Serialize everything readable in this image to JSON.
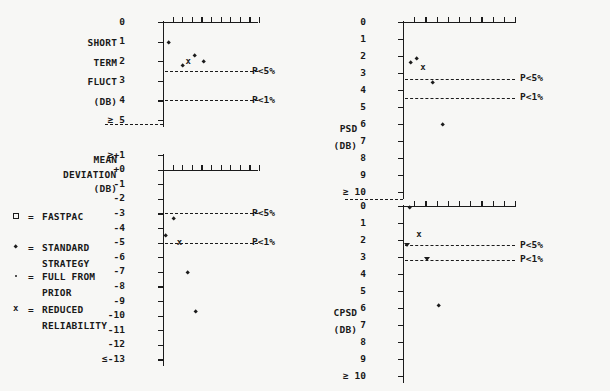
{
  "figure": {
    "kind": "four-panel-scatter",
    "background": "#f7f7f5",
    "ink": "#1b1b1b"
  },
  "legend": {
    "entries": [
      {
        "symbol": "open-square",
        "eq": "=",
        "line1": "FASTPAC",
        "line2": ""
      },
      {
        "symbol": "small-diamond",
        "eq": "=",
        "line1": "STANDARD",
        "line2": "STRATEGY"
      },
      {
        "symbol": "filled-dot",
        "eq": "=",
        "line1": "FULL FROM",
        "line2": "PRIOR"
      },
      {
        "symbol": "cross-x",
        "eq": "=",
        "line1": "REDUCED",
        "line2": "RELIABILITY"
      }
    ]
  },
  "significance_labels": {
    "p5": "P<5%",
    "p1": "P<1%"
  },
  "panels": [
    {
      "id": "short-term-fluct",
      "position": "top-left",
      "axis_title_lines": [
        "SHORT",
        "TERM",
        "FLUCT",
        "(DB)"
      ],
      "unit": "DB",
      "ytick_labels": [
        "0",
        "1",
        "2",
        "3",
        "4",
        "≥ 5"
      ],
      "yvalues": [
        0,
        1,
        2,
        3,
        4,
        5
      ],
      "xticks": 10,
      "ref_lines": [
        {
          "value": 2.5,
          "label": "P<5%"
        },
        {
          "value": 4.0,
          "label": "P<1%"
        }
      ],
      "points": [
        {
          "x": 0.55,
          "y": 1.05,
          "symbol": "small-diamond"
        },
        {
          "x": 2.1,
          "y": 2.25,
          "symbol": "small-diamond"
        },
        {
          "x": 2.65,
          "y": 2.05,
          "symbol": "cross-x"
        },
        {
          "x": 3.3,
          "y": 1.7,
          "symbol": "small-diamond"
        },
        {
          "x": 4.25,
          "y": 2.05,
          "symbol": "small-diamond"
        }
      ]
    },
    {
      "id": "mean-deviation",
      "position": "bottom-left",
      "axis_title_lines": [
        "MEAN",
        "DEVIATION",
        "(DB)"
      ],
      "unit": "DB",
      "ytick_labels": [
        "≥+1",
        "+0",
        "-1",
        "-2",
        "-3",
        "-4",
        "-5",
        "-6",
        "-7",
        "-8",
        "-9",
        "-10",
        "-11",
        "-12",
        "≤-13"
      ],
      "yvalues": [
        1,
        0,
        -1,
        -2,
        -3,
        -4,
        -5,
        -6,
        -7,
        -8,
        -9,
        -10,
        -11,
        -12,
        -13
      ],
      "xticks": 10,
      "ref_lines": [
        {
          "value": -3.0,
          "label": "P<5%"
        },
        {
          "value": -5.0,
          "label": "P<1%"
        }
      ],
      "points": [
        {
          "x": 1.1,
          "y": -3.35,
          "symbol": "small-diamond"
        },
        {
          "x": 0.28,
          "y": -4.55,
          "symbol": "small-diamond"
        },
        {
          "x": 1.75,
          "y": -5.05,
          "symbol": "cross-x"
        },
        {
          "x": 2.6,
          "y": -7.05,
          "symbol": "small-diamond"
        },
        {
          "x": 3.4,
          "y": -9.75,
          "symbol": "small-diamond"
        }
      ]
    },
    {
      "id": "psd",
      "position": "top-right",
      "axis_title_lines": [
        "PSD",
        "(DB)"
      ],
      "unit": "DB",
      "ytick_labels": [
        "0",
        "1",
        "2",
        "3",
        "4",
        "5",
        "6",
        "7",
        "8",
        "9",
        "≥ 10"
      ],
      "yvalues": [
        0,
        1,
        2,
        3,
        4,
        5,
        6,
        7,
        8,
        9,
        10
      ],
      "xticks": 10,
      "ref_lines": [
        {
          "value": 3.35,
          "label": "P<5%"
        },
        {
          "value": 4.45,
          "label": "P<1%"
        }
      ],
      "points": [
        {
          "x": 0.7,
          "y": 2.4,
          "symbol": "small-diamond"
        },
        {
          "x": 1.25,
          "y": 2.15,
          "symbol": "small-diamond"
        },
        {
          "x": 1.8,
          "y": 2.7,
          "symbol": "cross-x"
        },
        {
          "x": 2.65,
          "y": 3.55,
          "symbol": "small-diamond"
        },
        {
          "x": 3.5,
          "y": 6.05,
          "symbol": "small-diamond"
        }
      ]
    },
    {
      "id": "cpsd",
      "position": "bottom-right",
      "axis_title_lines": [
        "CPSD",
        "(DB)"
      ],
      "unit": "DB",
      "ytick_labels": [
        "0",
        "1",
        "2",
        "3",
        "4",
        "5",
        "6",
        "7",
        "8",
        "9",
        "≥ 10"
      ],
      "yvalues": [
        0,
        1,
        2,
        3,
        4,
        5,
        6,
        7,
        8,
        9,
        10
      ],
      "xticks": 10,
      "ref_lines": [
        {
          "value": 2.3,
          "label": "P<5%"
        },
        {
          "value": 3.15,
          "label": "P<1%"
        }
      ],
      "points": [
        {
          "x": 0.62,
          "y": 0.1,
          "symbol": "small-diamond"
        },
        {
          "x": 1.45,
          "y": 1.7,
          "symbol": "cross-x"
        },
        {
          "x": 0.42,
          "y": 2.3,
          "symbol": "triangle-down"
        },
        {
          "x": 2.2,
          "y": 3.15,
          "symbol": "triangle-down"
        },
        {
          "x": 3.2,
          "y": 5.85,
          "symbol": "small-diamond"
        }
      ]
    }
  ]
}
